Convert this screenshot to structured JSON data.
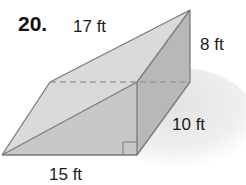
{
  "problem": {
    "number": "20."
  },
  "figure": {
    "type": "triangular prism",
    "labels": {
      "hypotenuse": "17 ft",
      "height": "8 ft",
      "depth": "10 ft",
      "base": "15 ft"
    },
    "colors": {
      "top_face": "#d9d9d9",
      "front_face": "#c4c4c4",
      "side_face": "#b3b3b3",
      "shadow": "#eeeeee",
      "edge": "#7a7a7a",
      "dashed_edge": "#9a9a9a"
    }
  }
}
